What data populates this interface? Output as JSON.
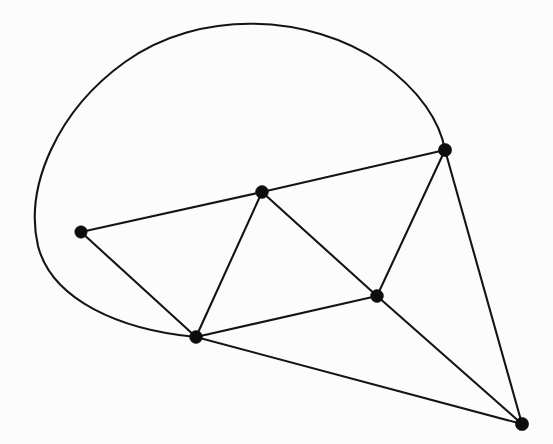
{
  "figure": {
    "kind": "graph-drawing",
    "background_color": "#fcfcfc",
    "ink_color": "#141414",
    "vertex_color": "#0d0d0d",
    "width": 553,
    "height": 444,
    "edge_stroke_width": 2.1,
    "vertex_radius": 6.2
  },
  "chart_data": {
    "type": "scatter",
    "subtitle": "",
    "xlabel": "",
    "ylabel": "",
    "xlim": [
      0,
      553
    ],
    "ylim": [
      0,
      444
    ],
    "grid": false,
    "legend": "none",
    "annotations": [],
    "tick_labels": {
      "x": [],
      "y": []
    },
    "nodes": [
      {
        "id": "A",
        "label": "",
        "x": 81,
        "y": 232,
        "degree": 2,
        "r": 6.2
      },
      {
        "id": "B",
        "label": "",
        "x": 262,
        "y": 192,
        "degree": 4,
        "r": 6.4
      },
      {
        "id": "C",
        "label": "",
        "x": 445,
        "y": 150,
        "degree": 4,
        "r": 6.6
      },
      {
        "id": "D",
        "label": "",
        "x": 377,
        "y": 296,
        "degree": 4,
        "r": 6.4
      },
      {
        "id": "E",
        "label": "",
        "x": 196,
        "y": 337,
        "degree": 5,
        "r": 6.4
      },
      {
        "id": "F",
        "label": "",
        "x": 522,
        "y": 424,
        "degree": 3,
        "r": 6.6
      }
    ],
    "edges": [
      {
        "id": "AB",
        "from": "A",
        "to": "B",
        "shape": "straight"
      },
      {
        "id": "AE",
        "from": "A",
        "to": "E",
        "shape": "straight"
      },
      {
        "id": "BC",
        "from": "B",
        "to": "C",
        "shape": "straight"
      },
      {
        "id": "BE",
        "from": "B",
        "to": "E",
        "shape": "straight"
      },
      {
        "id": "BD",
        "from": "B",
        "to": "D",
        "shape": "straight"
      },
      {
        "id": "CD",
        "from": "C",
        "to": "D",
        "shape": "straight"
      },
      {
        "id": "CF",
        "from": "C",
        "to": "F",
        "shape": "straight"
      },
      {
        "id": "DE",
        "from": "D",
        "to": "E",
        "shape": "straight"
      },
      {
        "id": "DF",
        "from": "D",
        "to": "F",
        "shape": "straight"
      },
      {
        "id": "EF",
        "from": "E",
        "to": "F",
        "shape": "straight"
      },
      {
        "id": "EC",
        "from": "E",
        "to": "C",
        "shape": "curved-arc",
        "path": "M 196 337 C 120 330, 52 300, 38 246 C 24 186, 58 110, 125 62 C 200 8, 310 14, 380 62 C 420 90, 440 122, 445 150"
      }
    ],
    "counts": {
      "vertices": 6,
      "straight_edges": 10,
      "curved_edges": 1,
      "total_edges": 11
    }
  }
}
